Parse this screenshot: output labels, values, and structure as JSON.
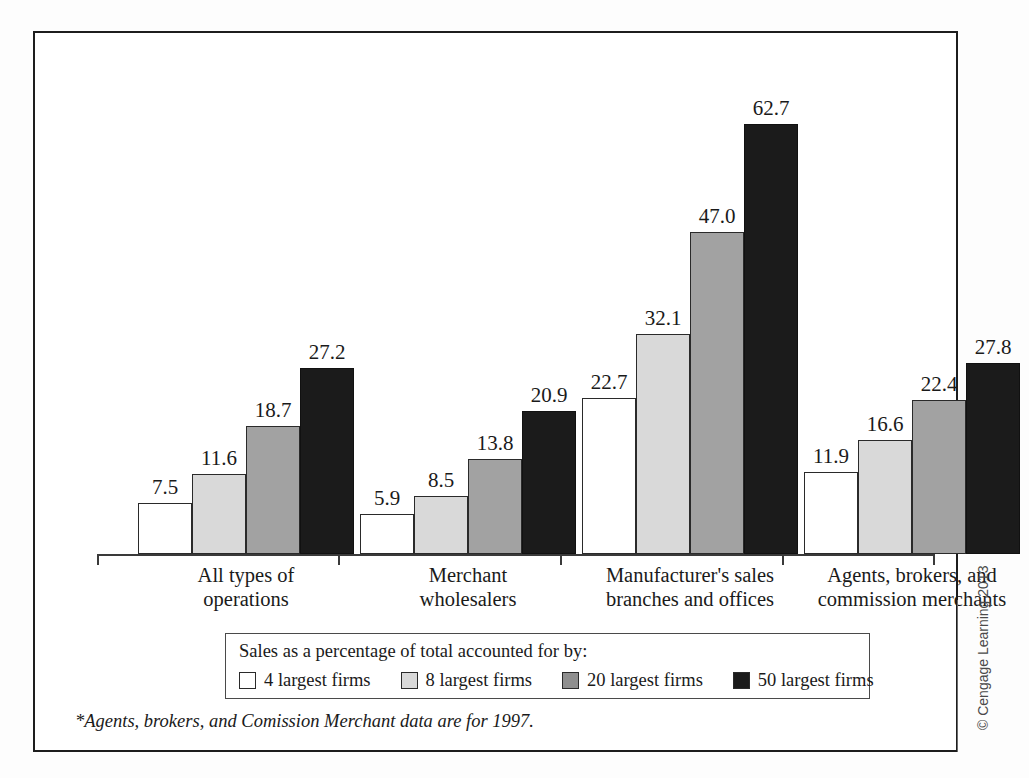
{
  "chart_data": {
    "type": "bar",
    "title": "",
    "xlabel": "",
    "ylabel": "",
    "ylim": [
      0,
      70
    ],
    "grid": false,
    "legend_position": "bottom-inside-box",
    "legend_title": "Sales as a percentage of total accounted for by:",
    "categories": [
      "All types of operations",
      "Merchant wholesalers",
      "Manufacturer's sales branches and offices",
      "Agents, brokers, and commission merchants"
    ],
    "category_lines": [
      [
        "All types of",
        "operations"
      ],
      [
        "Merchant",
        "wholesalers"
      ],
      [
        "Manufacturer's sales",
        "branches and offices"
      ],
      [
        "Agents, brokers, and",
        "commission merchants"
      ]
    ],
    "series": [
      {
        "name": "4 largest firms",
        "color": "#ffffff",
        "values": [
          7.5,
          5.9,
          22.7,
          11.9
        ]
      },
      {
        "name": "8 largest firms",
        "color": "#d9d9d9",
        "values": [
          11.6,
          8.5,
          32.1,
          16.6
        ]
      },
      {
        "name": "20 largest firms",
        "color": "#a2a2a2",
        "values": [
          18.7,
          13.8,
          47.0,
          22.4
        ]
      },
      {
        "name": "50 largest firms",
        "color": "#1b1b1b",
        "values": [
          27.2,
          20.9,
          62.7,
          27.8
        ]
      }
    ],
    "data_labels": [
      [
        "7.5",
        "11.6",
        "18.7",
        "27.2"
      ],
      [
        "5.9",
        "8.5",
        "13.8",
        "20.9"
      ],
      [
        "22.7",
        "32.1",
        "47.0",
        "62.7"
      ],
      [
        "11.9",
        "16.6",
        "22.4",
        "27.8"
      ]
    ],
    "annotations": [
      "*Agents, brokers, and Comission Merchant data are for 1997."
    ]
  },
  "legend": {
    "title": "Sales as a percentage of total accounted for by:",
    "items": [
      {
        "label": "4 largest firms"
      },
      {
        "label": "8 largest firms"
      },
      {
        "label": "20 largest firms"
      },
      {
        "label": "50 largest firms"
      }
    ]
  },
  "footnote": "*Agents, brokers, and Comission Merchant data are for 1997.",
  "copyright": "© Cengage Learning 2013",
  "colors": {
    "frame": "#1d1d1d",
    "axis": "#3a3a3a",
    "text": "#1a1a1a",
    "series_4": "#ffffff",
    "series_8": "#d9d9d9",
    "series_20": "#a2a2a2",
    "series_50": "#1b1b1b"
  }
}
